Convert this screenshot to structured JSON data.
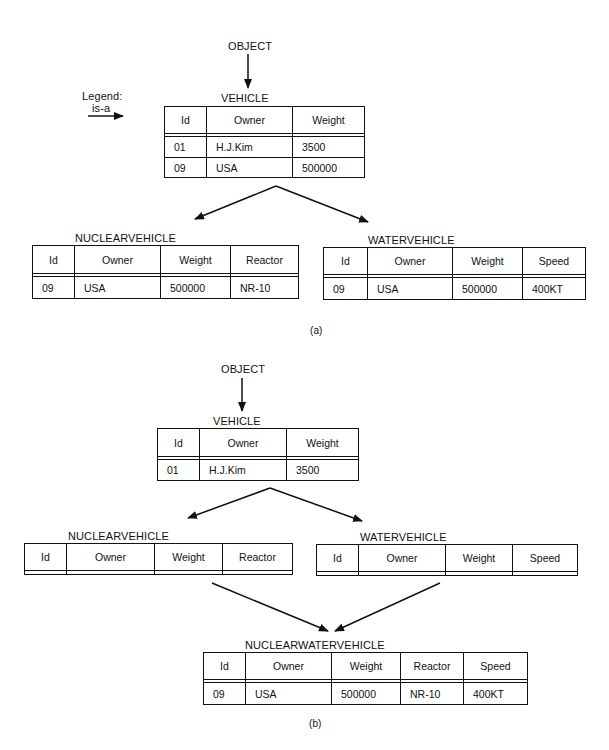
{
  "legend": {
    "title": "Legend:",
    "relation": "is-a"
  },
  "part_a": {
    "caption": "(a)",
    "root": "OBJECT",
    "vehicle": {
      "name": "VEHICLE",
      "columns": [
        "Id",
        "Owner",
        "Weight"
      ],
      "rows": [
        [
          "01",
          "H.J.Kim",
          "3500"
        ],
        [
          "09",
          "USA",
          "500000"
        ]
      ]
    },
    "nuclearvehicle": {
      "name": "NUCLEARVEHICLE",
      "columns": [
        "Id",
        "Owner",
        "Weight",
        "Reactor"
      ],
      "rows": [
        [
          "09",
          "USA",
          "500000",
          "NR-10"
        ]
      ]
    },
    "watervehicle": {
      "name": "WATERVEHICLE",
      "columns": [
        "Id",
        "Owner",
        "Weight",
        "Speed"
      ],
      "rows": [
        [
          "09",
          "USA",
          "500000",
          "400KT"
        ]
      ]
    }
  },
  "part_b": {
    "caption": "(b)",
    "root": "OBJECT",
    "vehicle": {
      "name": "VEHICLE",
      "columns": [
        "Id",
        "Owner",
        "Weight"
      ],
      "rows": [
        [
          "01",
          "H.J.Kim",
          "3500"
        ]
      ]
    },
    "nuclearvehicle": {
      "name": "NUCLEARVEHICLE",
      "columns": [
        "Id",
        "Owner",
        "Weight",
        "Reactor"
      ],
      "rows": []
    },
    "watervehicle": {
      "name": "WATERVEHICLE",
      "columns": [
        "Id",
        "Owner",
        "Weight",
        "Speed"
      ],
      "rows": []
    },
    "nuclearwatervehicle": {
      "name": "NUCLEARWATERVEHICLE",
      "columns": [
        "Id",
        "Owner",
        "Weight",
        "Reactor",
        "Speed"
      ],
      "rows": [
        [
          "09",
          "USA",
          "500000",
          "NR-10",
          "400KT"
        ]
      ]
    }
  }
}
